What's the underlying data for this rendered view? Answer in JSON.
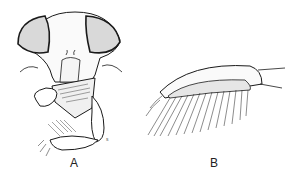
{
  "figure": {
    "panels": [
      {
        "id": "A",
        "label": "A",
        "subject": "insect head, frontal view with mouthparts"
      },
      {
        "id": "B",
        "label": "B",
        "subject": "appendage segment with comb of long setae"
      }
    ],
    "small_mark": "s"
  }
}
